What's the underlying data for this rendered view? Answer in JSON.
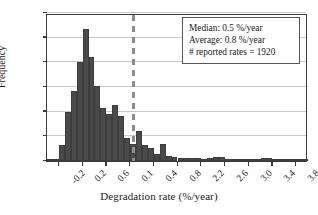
{
  "chart_data": {
    "type": "bar",
    "title": "",
    "xlabel": "Degradation rate (%/year)",
    "ylabel": "Frequency",
    "xlim": [
      -0.4,
      4.0
    ],
    "ylim": [
      0,
      300
    ],
    "grid": true,
    "bin_width": 0.1,
    "x_tick_labels": [
      "-0.2",
      "0.2",
      "0.6",
      "0.1",
      "0.4",
      "0.8",
      "2.2",
      "2.6",
      "3.0",
      "3.4",
      "3.8"
    ],
    "x_tick_values": [
      -0.2,
      0.2,
      0.6,
      1.0,
      1.4,
      1.8,
      2.2,
      2.6,
      3.0,
      3.4,
      3.8
    ],
    "y_tick_labels": [
      "0",
      "50",
      "100",
      "150",
      "200",
      "250",
      "300"
    ],
    "y_tick_values": [
      0,
      50,
      100,
      150,
      200,
      250,
      300
    ],
    "categories": [
      "-0.35",
      "-0.25",
      "-0.15",
      "-0.05",
      "0.05",
      "0.15",
      "0.25",
      "0.35",
      "0.45",
      "0.55",
      "0.65",
      "0.75",
      "0.85",
      "0.95",
      "1.05",
      "1.15",
      "1.25",
      "1.35",
      "1.45",
      "1.55",
      "1.65",
      "1.75",
      "1.85",
      "1.95",
      "2.05",
      "2.15",
      "2.25",
      "2.35",
      "2.45",
      "2.55",
      "2.65",
      "2.75",
      "2.85",
      "2.95",
      "3.05",
      "3.15",
      "3.25",
      "3.35",
      "3.45",
      "3.55",
      "3.65",
      "3.75",
      "3.85",
      "3.95"
    ],
    "values": [
      2,
      3,
      32,
      99,
      141,
      200,
      268,
      211,
      152,
      108,
      96,
      114,
      92,
      46,
      35,
      60,
      32,
      27,
      15,
      34,
      11,
      9,
      7,
      6,
      6,
      6,
      5,
      7,
      8,
      8,
      5,
      4,
      3,
      2,
      3,
      3,
      6,
      6,
      2,
      2,
      2,
      2,
      2,
      1
    ],
    "annotations": {
      "median_line_value": 1.05,
      "median_line_style": "dashed"
    },
    "legend": {
      "position": "top-right",
      "lines": [
        "Median: 0.5 %/year",
        "Average: 0.8 %/year",
        "# reported rates = 1920"
      ]
    },
    "colors": {
      "bar": "#4a4a4a",
      "axis": "#3a3a3a",
      "grid": "#c9c9c9",
      "median_line": "#8c8c8c",
      "background": "#ffffff"
    }
  }
}
